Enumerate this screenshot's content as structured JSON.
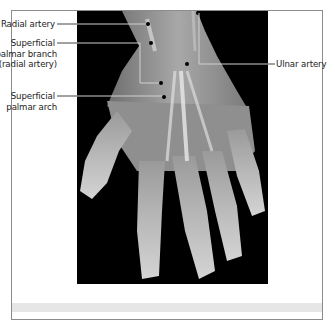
{
  "figure": {
    "labels": {
      "radial_artery": "Radial artery",
      "superficial_palmar_branch_line1": "Superficial",
      "superficial_palmar_branch_line2": "palmar branch",
      "superficial_palmar_branch_line3": "(radial artery)",
      "superficial_palmar_arch_line1": "Superficial",
      "superficial_palmar_arch_line2": "palmar arch",
      "ulnar_artery": "Ulnar artery"
    },
    "colors": {
      "frame_border": "#8c8c8c",
      "leader_line_on_photo": "#cfcfcf",
      "leader_line_on_white": "#444444",
      "dot": "#000000",
      "photo_background": "#000000",
      "caption_band": "#e6e6e6"
    }
  }
}
